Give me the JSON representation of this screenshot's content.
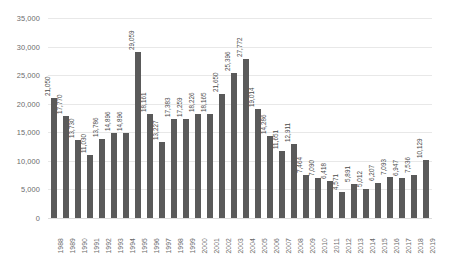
{
  "chart_data": {
    "type": "bar",
    "title": "",
    "subtitle": "",
    "xlabel": "",
    "ylabel": "",
    "ylim": [
      0,
      35000
    ],
    "ytick_labels": [
      "35,000",
      "30,000",
      "25,000",
      "20,000",
      "15,000",
      "10,000",
      "5,000",
      "0"
    ],
    "ytick_values": [
      35000,
      30000,
      25000,
      20000,
      15000,
      10000,
      5000,
      0
    ],
    "grid": true,
    "legend": "none",
    "bar_color": "#5a5a5a",
    "gridline_color": "#e8e8e8",
    "axis_text_color": "#6b6b6b",
    "label_text_color": "#4a4a4a",
    "background_color": "#ffffff",
    "categories": [
      "1988",
      "1989",
      "1990",
      "1991",
      "1992",
      "1993",
      "1994",
      "1995",
      "1996",
      "1997",
      "1998",
      "1999",
      "2000",
      "2001",
      "2002",
      "2003",
      "2004",
      "2005",
      "2006",
      "2007",
      "2008",
      "2009",
      "2010",
      "2011",
      "2012",
      "2013",
      "2014",
      "2015",
      "2016",
      "2017",
      "2018",
      "2019"
    ],
    "values": [
      21050,
      17770,
      13730,
      11030,
      13786,
      14896,
      14896,
      29059,
      18161,
      13227,
      17383,
      17259,
      18226,
      18165,
      21650,
      25396,
      27772,
      19014,
      14286,
      11651,
      12911,
      7464,
      7090,
      6418,
      4571,
      5891,
      5012,
      6207,
      7093,
      6947,
      7536,
      10129
    ],
    "data_labels": [
      "21,050",
      "17,770",
      "13,730",
      "11,030",
      "13,786",
      "14,896",
      "14,896",
      "29,059",
      "18,161",
      "13,227",
      "17,383",
      "17,259",
      "18,226",
      "18,165",
      "21,650",
      "25,396",
      "27,772",
      "19,014",
      "14,286",
      "11,651",
      "12,911",
      "7,464",
      "7,090",
      "6,418",
      "4,571",
      "5,891",
      "5,012",
      "6,207",
      "7,093",
      "6,947",
      "7,536",
      "10,129"
    ]
  }
}
